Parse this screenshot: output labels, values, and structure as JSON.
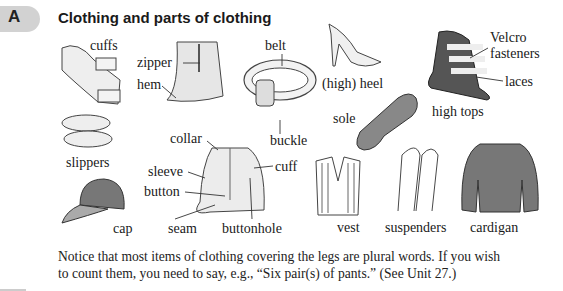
{
  "section": {
    "letter": "A",
    "title": "Clothing and parts of clothing"
  },
  "labels": {
    "cuffs": "cuffs",
    "zipper": "zipper",
    "hem": "hem",
    "belt": "belt",
    "high_heel": "(high) heel",
    "velcro": "Velcro",
    "fasteners": "fasteners",
    "laces": "laces",
    "sole": "sole",
    "high_tops": "high tops",
    "buckle": "buckle",
    "slippers": "slippers",
    "collar": "collar",
    "sleeve": "sleeve",
    "button": "button",
    "cuff": "cuff",
    "cap": "cap",
    "seam": "seam",
    "buttonhole": "buttonhole",
    "vest": "vest",
    "suspenders": "suspenders",
    "cardigan": "cardigan"
  },
  "note": {
    "line1": "Notice that most items of clothing covering the legs are plural words. If you wish",
    "line2": "to count them, you need to say, e.g., “Six pair(s) of pants.” (See Unit 27.)"
  }
}
